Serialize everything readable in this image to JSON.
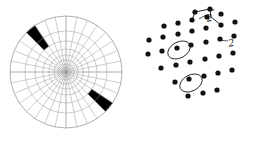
{
  "figure": {
    "background_color": "#ffffff",
    "line_color": "#9a9a9a",
    "fill_color": "#000000",
    "dot_color": "#111111"
  },
  "panels": {
    "polar": {
      "name": "polar-sector-diagram",
      "center_x": 66,
      "center_y": 72,
      "outer_radius": 56,
      "spokes": 32,
      "ring_radii": [
        5,
        8,
        12,
        17,
        23,
        31,
        41,
        56
      ],
      "filled_sectors": [
        {
          "name": "filled-sector-upper-left",
          "spoke_index": 11,
          "ring_from": 5,
          "ring_to": 7
        },
        {
          "name": "filled-sector-lower-right",
          "spoke_index": 28,
          "ring_from": 5,
          "ring_to": 7
        }
      ]
    },
    "lattice": {
      "name": "dot-lattice-diagram",
      "dot_radius": 2.6,
      "rows": [
        {
          "points": [
            [
              62,
              12
            ],
            [
              77,
              9
            ]
          ]
        },
        {
          "points": [
            [
              31,
              26
            ],
            [
              45,
              23
            ],
            [
              59,
              20
            ],
            [
              74,
              17
            ],
            [
              88,
              14
            ]
          ]
        },
        {
          "points": [
            [
              16,
              40
            ],
            [
              30,
              37
            ],
            [
              45,
              34
            ],
            [
              59,
              31
            ],
            [
              73,
              28
            ],
            [
              88,
              25
            ],
            [
              102,
              22
            ]
          ]
        },
        {
          "points": [
            [
              15,
              54
            ],
            [
              29,
              51
            ],
            [
              44,
              48
            ],
            [
              58,
              45
            ],
            [
              73,
              42
            ],
            [
              87,
              39
            ],
            [
              101,
              36
            ]
          ]
        },
        {
          "points": [
            [
              28,
              68
            ],
            [
              43,
              65
            ],
            [
              57,
              62
            ],
            [
              72,
              59
            ],
            [
              86,
              56
            ],
            [
              100,
              53
            ]
          ]
        },
        {
          "points": [
            [
              42,
              82
            ],
            [
              56,
              79
            ],
            [
              71,
              76
            ],
            [
              85,
              73
            ],
            [
              99,
              70
            ]
          ]
        },
        {
          "points": [
            [
              55,
              96
            ],
            [
              70,
              93
            ],
            [
              84,
              90
            ]
          ]
        }
      ],
      "circled_points": [
        {
          "name": "circled-lattice-point-1",
          "cx": 46,
          "cy": 50,
          "rx": 12,
          "ry": 8,
          "rotation": -28
        },
        {
          "name": "circled-lattice-point-2",
          "cx": 58,
          "cy": 83,
          "rx": 12,
          "ry": 8,
          "rotation": -28
        }
      ],
      "leaders": [
        {
          "name": "leader-line-2dprime",
          "path": "M 73,15 L 66,19"
        },
        {
          "name": "leader-line-2prime",
          "path": "M 95,41 L 86,40"
        }
      ],
      "bond_path": "M 59,20 L 62,12 L 77,9 L 78,17 L 88,25",
      "labels": [
        {
          "id": "label-2dprime",
          "name": "label-two-double-prime",
          "base": "2",
          "sup": "″"
        },
        {
          "id": "label-2prime",
          "name": "label-two-prime",
          "base": "2",
          "sup": "′"
        }
      ]
    }
  }
}
